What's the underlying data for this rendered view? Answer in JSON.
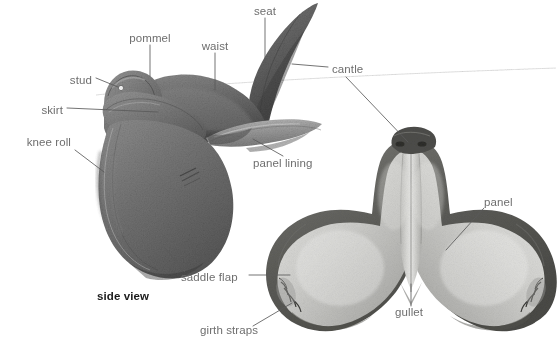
{
  "figure": {
    "width": 557,
    "height": 355,
    "background_color": "#ffffff",
    "label_color": "#6e6e6e",
    "leader_color": "#5a5a5a",
    "caption_color": "#1a1a1a"
  },
  "views": [
    {
      "id": "side-view",
      "caption": "side view"
    },
    {
      "id": "bottom-view",
      "caption": ""
    }
  ],
  "labels": [
    {
      "id": "pommel",
      "text": "pommel",
      "x": 150,
      "y": 39,
      "align": "ctr",
      "bold": false
    },
    {
      "id": "waist",
      "text": "waist",
      "x": 215,
      "y": 47,
      "align": "ctr",
      "bold": false
    },
    {
      "id": "seat",
      "text": "seat",
      "x": 265,
      "y": 12,
      "align": "ctr",
      "bold": false
    },
    {
      "id": "stud",
      "text": "stud",
      "x": 92,
      "y": 81,
      "align": "right",
      "bold": false
    },
    {
      "id": "skirt",
      "text": "skirt",
      "x": 63,
      "y": 112,
      "align": "right",
      "bold": false
    },
    {
      "id": "knee-roll",
      "text": "knee roll",
      "x": 71,
      "y": 142,
      "align": "right",
      "bold": false
    },
    {
      "id": "cantle",
      "text": "cantle",
      "x": 332,
      "y": 70,
      "align": "left",
      "bold": false
    },
    {
      "id": "panel-lining",
      "text": "panel lining",
      "x": 253,
      "y": 162,
      "align": "left",
      "bold": false
    },
    {
      "id": "panel",
      "text": "panel",
      "x": 484,
      "y": 202,
      "align": "left",
      "bold": false
    },
    {
      "id": "saddle-flap",
      "text": "saddle flap",
      "x": 181,
      "y": 278,
      "align": "left",
      "bold": false
    },
    {
      "id": "girth-straps",
      "text": "girth straps",
      "x": 200,
      "y": 330,
      "align": "left",
      "bold": false
    },
    {
      "id": "gullet",
      "text": "gullet",
      "x": 395,
      "y": 312,
      "align": "left",
      "bold": false
    },
    {
      "id": "side-view-caption",
      "text": "side view",
      "x": 97,
      "y": 296,
      "align": "left",
      "bold": true
    }
  ],
  "parts": [
    {
      "name": "pommel",
      "view": "side"
    },
    {
      "name": "waist",
      "view": "side"
    },
    {
      "name": "seat",
      "view": "side"
    },
    {
      "name": "stud",
      "view": "side"
    },
    {
      "name": "skirt",
      "view": "side"
    },
    {
      "name": "knee roll",
      "view": "side"
    },
    {
      "name": "cantle",
      "view": "side and bottom"
    },
    {
      "name": "panel lining",
      "view": "side"
    },
    {
      "name": "panel",
      "view": "bottom"
    },
    {
      "name": "saddle flap",
      "view": "side and bottom"
    },
    {
      "name": "girth straps",
      "view": "bottom"
    },
    {
      "name": "gullet",
      "view": "bottom"
    }
  ]
}
